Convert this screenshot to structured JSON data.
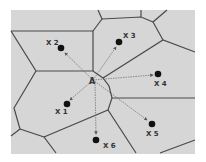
{
  "diagram": {
    "type": "voronoi-nearest-neighbor",
    "background": "#d6d6d6",
    "edge_color": "#4a4a4a",
    "query_point": {
      "label": "A",
      "x": 93,
      "y": 80
    },
    "sites": [
      {
        "label": "X1",
        "x": 67,
        "y": 104,
        "lx": 55,
        "ly": 114
      },
      {
        "label": "X2",
        "x": 61,
        "y": 48,
        "lx": 46,
        "ly": 45
      },
      {
        "label": "X3",
        "x": 119,
        "y": 42,
        "lx": 123,
        "ly": 38
      },
      {
        "label": "X4",
        "x": 158,
        "y": 74,
        "lx": 154,
        "ly": 86
      },
      {
        "label": "X5",
        "x": 152,
        "y": 124,
        "lx": 146,
        "ly": 136
      },
      {
        "label": "X6",
        "x": 96,
        "y": 140,
        "lx": 103,
        "ly": 148
      }
    ]
  }
}
